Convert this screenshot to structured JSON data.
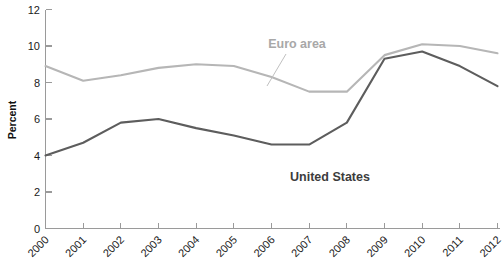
{
  "chart_data": {
    "type": "line",
    "title": "",
    "xlabel": "",
    "ylabel": "Percent",
    "x": [
      "2000",
      "2001",
      "2002",
      "2003",
      "2004",
      "2005",
      "2006",
      "2007",
      "2008",
      "2009",
      "2010",
      "2011",
      "2012"
    ],
    "categories": [
      "2000",
      "2001",
      "2002",
      "2003",
      "2004",
      "2005",
      "2006",
      "2007",
      "2008",
      "2009",
      "2010",
      "2011",
      "2012"
    ],
    "ylim": [
      0,
      12
    ],
    "yticks": [
      0,
      2,
      4,
      6,
      8,
      10,
      12
    ],
    "ytick_labels": [
      "0",
      "2",
      "4",
      "6",
      "8",
      "10",
      "12"
    ],
    "grid": false,
    "legend": "inline-annotations",
    "series": [
      {
        "name": "Euro area",
        "color": "#b6b6b6",
        "values": [
          8.9,
          8.1,
          8.4,
          8.8,
          9.0,
          8.9,
          8.3,
          7.5,
          7.5,
          9.5,
          10.1,
          10.0,
          9.6
        ]
      },
      {
        "name": "United States",
        "color": "#5d5d5d",
        "values": [
          4.0,
          4.7,
          5.8,
          6.0,
          5.5,
          5.1,
          4.6,
          4.6,
          5.8,
          9.3,
          9.7,
          8.9,
          7.8
        ]
      }
    ],
    "annotations": [
      {
        "text": "Euro area",
        "series": "Euro area",
        "x_px": 297,
        "y_px": 44
      },
      {
        "text": "United States",
        "series": "United States",
        "x_px": 330,
        "y_px": 177
      }
    ]
  },
  "axis": {
    "y_title": "Percent"
  }
}
